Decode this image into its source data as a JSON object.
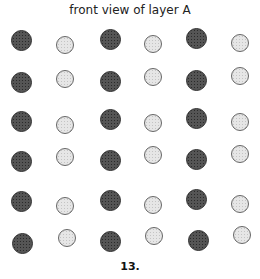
{
  "title": "front view of layer A",
  "caption": "13.",
  "grid": {
    "rows": 6,
    "cols": 6,
    "pattern": "alternating columns: dark, light, dark, light, dark, light",
    "atoms": [
      {
        "type": "dark",
        "x": 21,
        "y": 40
      },
      {
        "type": "light",
        "x": 65,
        "y": 45
      },
      {
        "type": "dark",
        "x": 110,
        "y": 39
      },
      {
        "type": "light",
        "x": 153,
        "y": 44
      },
      {
        "type": "dark",
        "x": 196,
        "y": 38
      },
      {
        "type": "light",
        "x": 240,
        "y": 43
      },
      {
        "type": "dark",
        "x": 21,
        "y": 82
      },
      {
        "type": "light",
        "x": 65,
        "y": 79
      },
      {
        "type": "dark",
        "x": 110,
        "y": 81
      },
      {
        "type": "light",
        "x": 153,
        "y": 77
      },
      {
        "type": "dark",
        "x": 196,
        "y": 80
      },
      {
        "type": "light",
        "x": 240,
        "y": 76
      },
      {
        "type": "dark",
        "x": 21,
        "y": 121
      },
      {
        "type": "light",
        "x": 65,
        "y": 125
      },
      {
        "type": "dark",
        "x": 110,
        "y": 119
      },
      {
        "type": "light",
        "x": 153,
        "y": 123
      },
      {
        "type": "dark",
        "x": 196,
        "y": 118
      },
      {
        "type": "light",
        "x": 240,
        "y": 122
      },
      {
        "type": "dark",
        "x": 21,
        "y": 161
      },
      {
        "type": "light",
        "x": 65,
        "y": 157
      },
      {
        "type": "dark",
        "x": 110,
        "y": 160
      },
      {
        "type": "light",
        "x": 153,
        "y": 155
      },
      {
        "type": "dark",
        "x": 196,
        "y": 159
      },
      {
        "type": "light",
        "x": 240,
        "y": 154
      },
      {
        "type": "dark",
        "x": 21,
        "y": 201
      },
      {
        "type": "light",
        "x": 65,
        "y": 206
      },
      {
        "type": "dark",
        "x": 110,
        "y": 200
      },
      {
        "type": "light",
        "x": 153,
        "y": 205
      },
      {
        "type": "dark",
        "x": 196,
        "y": 199
      },
      {
        "type": "light",
        "x": 240,
        "y": 204
      },
      {
        "type": "dark",
        "x": 22,
        "y": 243
      },
      {
        "type": "light",
        "x": 67,
        "y": 238
      },
      {
        "type": "dark",
        "x": 110,
        "y": 241
      },
      {
        "type": "light",
        "x": 154,
        "y": 236
      },
      {
        "type": "dark",
        "x": 198,
        "y": 240
      },
      {
        "type": "light",
        "x": 242,
        "y": 235
      }
    ]
  }
}
